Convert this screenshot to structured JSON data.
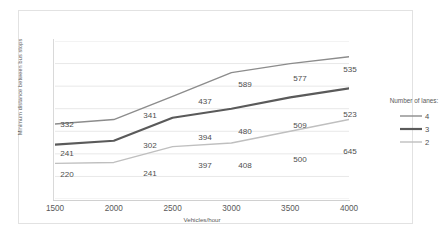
{
  "chart_data": {
    "type": "line",
    "title": "",
    "xlabel": "Vehicles/hour",
    "ylabel": "Minimum distance between bus stops",
    "x": [
      1500,
      2000,
      2500,
      3000,
      3500,
      4000
    ],
    "xticklabels": [
      "1500",
      "2000",
      "2500",
      "3000",
      "3500",
      "4000"
    ],
    "xlim": [
      1500,
      4000
    ],
    "ylim": [
      0,
      700
    ],
    "grid": "horizontal",
    "legend_position": "right",
    "legend_title": "Number of lanes:",
    "series": [
      {
        "name": "4",
        "legend_label": "4",
        "color": "#8c8c8c",
        "width": 1.4,
        "values": [
          332,
          341,
          437,
          589,
          577,
          535
        ],
        "labels": [
          "332",
          "341",
          "437",
          "589",
          "577",
          "535"
        ],
        "plot_y": [
          332,
          352,
          455,
          560,
          600,
          630
        ]
      },
      {
        "name": "3",
        "legend_label": "3",
        "color": "#5a5a5a",
        "width": 2.2,
        "values": [
          241,
          302,
          394,
          480,
          509,
          523
        ],
        "labels": [
          "241",
          "302",
          "394",
          "480",
          "509",
          "523"
        ],
        "plot_y": [
          241,
          258,
          360,
          400,
          450,
          490
        ]
      },
      {
        "name": "2",
        "legend_label": "2",
        "color": "#bfbfbf",
        "width": 1.4,
        "values": [
          220,
          241,
          397,
          408,
          500,
          645
        ],
        "labels": [
          "220",
          "241",
          "397",
          "408",
          "500",
          "645"
        ],
        "plot_y": [
          158,
          162,
          232,
          248,
          300,
          352
        ]
      }
    ],
    "label_positions": {
      "4": [
        {
          "text": "332",
          "x": 12,
          "y": 83
        },
        {
          "text": "341",
          "x": 95,
          "y": 74
        },
        {
          "text": "437",
          "x": 150,
          "y": 60
        },
        {
          "text": "589",
          "x": 190,
          "y": 43
        },
        {
          "text": "577",
          "x": 245,
          "y": 37
        },
        {
          "text": "535",
          "x": 295,
          "y": 28
        }
      ],
      "3": [
        {
          "text": "241",
          "x": 12,
          "y": 112
        },
        {
          "text": "302",
          "x": 95,
          "y": 104
        },
        {
          "text": "394",
          "x": 150,
          "y": 96
        },
        {
          "text": "480",
          "x": 190,
          "y": 90
        },
        {
          "text": "509",
          "x": 245,
          "y": 84
        },
        {
          "text": "523",
          "x": 295,
          "y": 73
        }
      ],
      "2": [
        {
          "text": "220",
          "x": 12,
          "y": 133
        },
        {
          "text": "241",
          "x": 95,
          "y": 132
        },
        {
          "text": "397",
          "x": 150,
          "y": 124
        },
        {
          "text": "408",
          "x": 190,
          "y": 124
        },
        {
          "text": "500",
          "x": 245,
          "y": 118
        },
        {
          "text": "645",
          "x": 295,
          "y": 110
        }
      ]
    }
  }
}
